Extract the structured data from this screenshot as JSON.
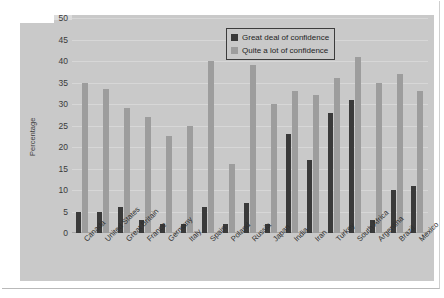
{
  "chart_data": {
    "type": "bar",
    "title": "",
    "xlabel": "",
    "ylabel": "Percentage",
    "ylim": [
      0,
      50
    ],
    "yticks": [
      0,
      5,
      10,
      15,
      20,
      25,
      30,
      35,
      40,
      45,
      50
    ],
    "grid": true,
    "legend_position": "top-right",
    "categories": [
      "Canada",
      "United States",
      "Great Britain",
      "France",
      "Germany",
      "Italy",
      "Spain",
      "Poland",
      "Russia",
      "Japan",
      "India",
      "Iran",
      "Turkey",
      "South Africa",
      "Argentina",
      "Brazil",
      "Mexico"
    ],
    "series": [
      {
        "name": "Great deal of confidence",
        "color": "#3a3a3a",
        "values": [
          5,
          5,
          6,
          3,
          2,
          2,
          6,
          2,
          7,
          2,
          23,
          17,
          28,
          31,
          3,
          10,
          11
        ]
      },
      {
        "name": "Quite a lot of confidence",
        "color": "#9d9d9d",
        "values": [
          35,
          33.5,
          29,
          27,
          22.5,
          25,
          40,
          16,
          39,
          30,
          33,
          32,
          36,
          41,
          35,
          37,
          33
        ]
      }
    ]
  },
  "legend": {
    "items": [
      {
        "label": "Great deal of confidence",
        "swatch": "dark-swatch"
      },
      {
        "label": "Quite a lot of confidence",
        "swatch": "light-swatch"
      }
    ]
  },
  "colors": {
    "dark_series": "#3a3a3a",
    "light_series": "#9d9d9d",
    "plot_background": "#c9c9c9",
    "gridline": "#d7d7d7",
    "page_background": "#ffffff"
  }
}
